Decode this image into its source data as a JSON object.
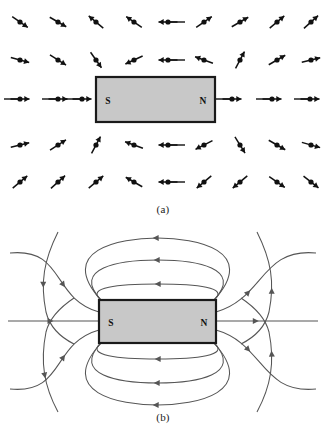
{
  "figure": {
    "width": 326,
    "height": 433,
    "background": "#ffffff"
  },
  "colors": {
    "magnet_fill": "#c8c8c8",
    "magnet_stroke": "#1a1a1a",
    "needle": "#111111",
    "field_line": "#555555",
    "caption_text": "#1a1a1a"
  },
  "panels": [
    {
      "id": "a",
      "caption": "(a)",
      "description": "Compass needles arranged on a grid around a bar magnet",
      "magnet": {
        "x": 96,
        "y": 77,
        "width": 119,
        "height": 45,
        "south_label": "S",
        "north_label": "N",
        "south_label_x": 108,
        "north_label_x": 203,
        "label_y": 104
      },
      "needle_rows": [
        {
          "y": 22,
          "needles": [
            {
              "x": 20,
              "angle": 35
            },
            {
              "x": 58,
              "angle": 30
            },
            {
              "x": 96,
              "angle": -140
            },
            {
              "x": 134,
              "angle": -145
            },
            {
              "x": 168,
              "angle": 180
            },
            {
              "x": 204,
              "angle": -35
            },
            {
              "x": 240,
              "angle": -30
            },
            {
              "x": 277,
              "angle": -40
            },
            {
              "x": 311,
              "angle": -42
            }
          ]
        },
        {
          "y": 60,
          "needles": [
            {
              "x": 20,
              "angle": 15
            },
            {
              "x": 58,
              "angle": 32
            },
            {
              "x": 96,
              "angle": 55
            },
            {
              "x": 134,
              "angle": 155
            },
            {
              "x": 168,
              "angle": 180
            },
            {
              "x": 204,
              "angle": -160
            },
            {
              "x": 240,
              "angle": -62
            },
            {
              "x": 277,
              "angle": -30
            },
            {
              "x": 311,
              "angle": -14
            }
          ]
        },
        {
          "y": 99,
          "needles": [
            {
              "x": 20,
              "angle": 0
            },
            {
              "x": 58,
              "angle": 0
            },
            {
              "x": 82,
              "angle": 0
            },
            {
              "x": 232,
              "angle": 0
            },
            {
              "x": 272,
              "angle": 0
            },
            {
              "x": 310,
              "angle": 0
            }
          ]
        },
        {
          "y": 145,
          "needles": [
            {
              "x": 20,
              "angle": -14
            },
            {
              "x": 58,
              "angle": -33
            },
            {
              "x": 96,
              "angle": -62
            },
            {
              "x": 134,
              "angle": -160
            },
            {
              "x": 168,
              "angle": 180
            },
            {
              "x": 204,
              "angle": 153
            },
            {
              "x": 240,
              "angle": 58
            },
            {
              "x": 277,
              "angle": 30
            },
            {
              "x": 311,
              "angle": 16
            }
          ]
        },
        {
          "y": 182,
          "needles": [
            {
              "x": 20,
              "angle": -40
            },
            {
              "x": 58,
              "angle": -42
            },
            {
              "x": 96,
              "angle": -40
            },
            {
              "x": 134,
              "angle": -150
            },
            {
              "x": 168,
              "angle": 180
            },
            {
              "x": 204,
              "angle": 140
            },
            {
              "x": 240,
              "angle": 140
            },
            {
              "x": 277,
              "angle": 35
            },
            {
              "x": 311,
              "angle": 38
            }
          ]
        }
      ]
    },
    {
      "id": "b",
      "caption": "(b)",
      "description": "Continuous magnetic field lines around a bar magnet",
      "magnet": {
        "x": 99,
        "y": 80,
        "width": 117,
        "height": 43,
        "south_label": "S",
        "north_label": "N",
        "south_label_x": 111,
        "north_label_x": 204,
        "label_y": 106
      },
      "field_lines": {
        "axis_line": {
          "y": 101,
          "x_start": 8,
          "x_end": 318
        },
        "loop_count_top": 3,
        "loop_count_bottom": 3,
        "fan_count_each_side": 2,
        "direction": "left-to-right through magnet, arrows point toward N outside"
      }
    }
  ]
}
